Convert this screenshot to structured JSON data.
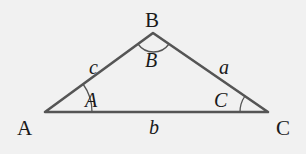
{
  "diagram": {
    "colors": {
      "background": "#f1f1f1",
      "line": "#555555",
      "text": "#1a1a1a"
    },
    "vertices": [
      {
        "id": "A",
        "label": "A",
        "x": 45,
        "y": 112
      },
      {
        "id": "B",
        "label": "B",
        "x": 153,
        "y": 33
      },
      {
        "id": "C",
        "label": "C",
        "x": 268,
        "y": 112
      }
    ],
    "sides": [
      {
        "id": "a",
        "label": "a",
        "between": [
          "B",
          "C"
        ]
      },
      {
        "id": "b",
        "label": "b",
        "between": [
          "A",
          "C"
        ]
      },
      {
        "id": "c",
        "label": "c",
        "between": [
          "A",
          "B"
        ]
      }
    ],
    "angles": [
      {
        "id": "A",
        "label": "A",
        "at": "A"
      },
      {
        "id": "B",
        "label": "B",
        "at": "B"
      },
      {
        "id": "C",
        "label": "C",
        "at": "C"
      }
    ]
  }
}
